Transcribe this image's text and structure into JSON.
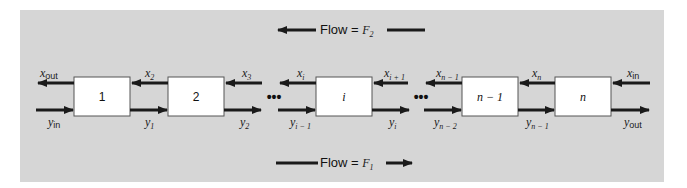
{
  "diagram": {
    "flow_top": {
      "label": "Flow = ",
      "symbol": "F",
      "subscript": "2",
      "direction": "left"
    },
    "flow_bottom": {
      "label": "Flow = ",
      "symbol": "F",
      "subscript": "1",
      "direction": "right"
    },
    "stages": [
      {
        "label": "1",
        "italic": false
      },
      {
        "label": "2",
        "italic": false
      },
      {
        "label": "i",
        "italic": true
      },
      {
        "label": "n − 1",
        "italic": true
      },
      {
        "label": "n",
        "italic": true
      }
    ],
    "ellipsis": "•••",
    "x_streams": [
      {
        "base": "x",
        "sub": "out"
      },
      {
        "base": "x",
        "sub": "2"
      },
      {
        "base": "x",
        "sub": "3"
      },
      {
        "base": "x",
        "sub": "i"
      },
      {
        "base": "x",
        "sub": "i + 1"
      },
      {
        "base": "x",
        "sub": "n − 1"
      },
      {
        "base": "x",
        "sub": "n"
      },
      {
        "base": "x",
        "sub": "in"
      }
    ],
    "y_streams": [
      {
        "base": "y",
        "sub": "in"
      },
      {
        "base": "y",
        "sub": "1"
      },
      {
        "base": "y",
        "sub": "2"
      },
      {
        "base": "y",
        "sub": "i − 1"
      },
      {
        "base": "y",
        "sub": "i"
      },
      {
        "base": "y",
        "sub": "n − 2"
      },
      {
        "base": "y",
        "sub": "n − 1"
      },
      {
        "base": "y",
        "sub": "out"
      }
    ],
    "colors": {
      "panel": "#d6d6d6",
      "box_fill": "#ffffff",
      "stroke": "#1a1a1a"
    }
  }
}
